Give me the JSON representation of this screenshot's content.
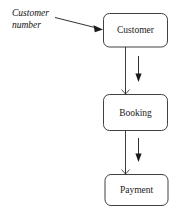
{
  "diagram": {
    "entities": [
      {
        "id": "customer",
        "label": "Customer"
      },
      {
        "id": "booking",
        "label": "Booking"
      },
      {
        "id": "payment",
        "label": "Payment"
      }
    ],
    "annotations": [
      {
        "id": "customer-number",
        "line1": "Customer",
        "line2": "number"
      }
    ],
    "relationships": [
      {
        "id": "customer-to-booking",
        "from": "Customer",
        "to": "Booking",
        "direction": "down",
        "end_marker": "crow-foot"
      },
      {
        "id": "booking-to-payment",
        "from": "Booking",
        "to": "Payment",
        "direction": "down",
        "end_marker": "crow-foot"
      }
    ],
    "colors": {
      "background": "#ffffff",
      "stroke": "#2b2b2b",
      "text": "#1a1a1a"
    }
  }
}
